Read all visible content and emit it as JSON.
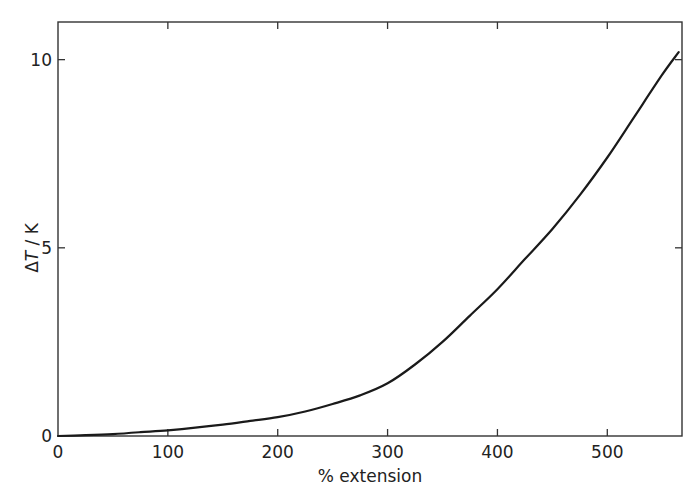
{
  "chart_data": {
    "type": "line",
    "title": "",
    "xlabel": "% extension",
    "ylabel": "ΔT / K",
    "ylabel_parts": {
      "delta": "Δ",
      "symbol": "T",
      "unit": "/ K"
    },
    "xlim": [
      0,
      568
    ],
    "ylim": [
      0,
      11
    ],
    "xticks": [
      0,
      100,
      200,
      300,
      400,
      500
    ],
    "xtick_labels": [
      "0",
      "100",
      "200",
      "300",
      "400",
      "500"
    ],
    "yticks": [
      0,
      5,
      10
    ],
    "ytick_labels": [
      "0",
      "5",
      "10"
    ],
    "grid": false,
    "legend": null,
    "series": [
      {
        "name": "ΔT vs % extension",
        "x": [
          0,
          25,
          50,
          75,
          100,
          125,
          150,
          175,
          200,
          225,
          250,
          275,
          300,
          325,
          350,
          375,
          400,
          425,
          450,
          475,
          500,
          525,
          550,
          565
        ],
        "y": [
          0,
          0.02,
          0.05,
          0.1,
          0.15,
          0.22,
          0.3,
          0.4,
          0.5,
          0.65,
          0.85,
          1.08,
          1.4,
          1.9,
          2.5,
          3.2,
          3.9,
          4.7,
          5.5,
          6.4,
          7.4,
          8.5,
          9.6,
          10.2
        ]
      }
    ],
    "colors": {
      "line": "#1a1a1a",
      "axis": "#333333",
      "background": "#ffffff"
    }
  }
}
